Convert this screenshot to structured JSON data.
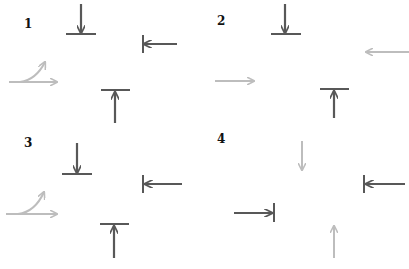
{
  "colors": {
    "dark": "#585858",
    "light": "#bdbdbd",
    "label": "#111111"
  },
  "panels": [
    {
      "label": "1"
    },
    {
      "label": "2"
    },
    {
      "label": "3"
    },
    {
      "label": "4"
    }
  ]
}
